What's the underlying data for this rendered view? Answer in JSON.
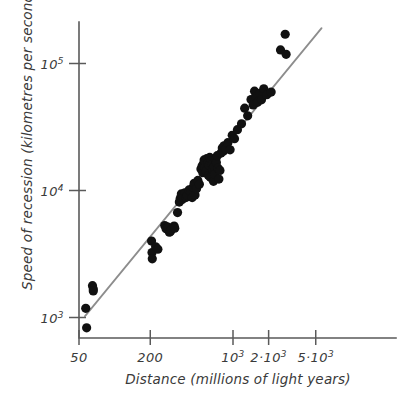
{
  "chart_data": {
    "type": "scatter",
    "title": "",
    "xlabel": "Distance (millions of light years)",
    "ylabel": "Speed of recession (kilometres per second)",
    "xscale": "log",
    "yscale": "log",
    "xlim": [
      50,
      6500
    ],
    "ylim": [
      800,
      220000
    ],
    "grid": false,
    "legend": null,
    "xticks": [
      {
        "value": 50,
        "label": "50",
        "mantissa": "50",
        "exponent": ""
      },
      {
        "value": 200,
        "label": "200",
        "mantissa": "200",
        "exponent": ""
      },
      {
        "value": 1000,
        "label": "10^3",
        "mantissa": "10",
        "exponent": "3"
      },
      {
        "value": 2000,
        "label": "2·10^3",
        "mantissa": "2·10",
        "exponent": "3"
      },
      {
        "value": 5000,
        "label": "5·10^3",
        "mantissa": "5·10",
        "exponent": "3"
      }
    ],
    "yticks": [
      {
        "value": 1000,
        "label": "10^3",
        "mantissa": "10",
        "exponent": "3"
      },
      {
        "value": 10000,
        "label": "10^4",
        "mantissa": "10",
        "exponent": "4"
      },
      {
        "value": 100000,
        "label": "10^5",
        "mantissa": "10",
        "exponent": "5"
      }
    ],
    "trendline": {
      "name": "Hubble law fit",
      "color": "#8d8d8d",
      "x": [
        56,
        5600
      ],
      "y": [
        1020,
        190000
      ]
    },
    "series": [
      {
        "name": "Galaxies",
        "color": "#111111",
        "marker": "circle",
        "marker_size": 4.6,
        "points": [
          [
            57,
            1180
          ],
          [
            58,
            830
          ],
          [
            65,
            1780
          ],
          [
            66,
            1680
          ],
          [
            66,
            1620
          ],
          [
            205,
            4000
          ],
          [
            207,
            3250
          ],
          [
            208,
            2900
          ],
          [
            222,
            3600
          ],
          [
            232,
            3450
          ],
          [
            265,
            5300
          ],
          [
            272,
            5000
          ],
          [
            282,
            5150
          ],
          [
            290,
            4700
          ],
          [
            296,
            4750
          ],
          [
            300,
            4900
          ],
          [
            318,
            5250
          ],
          [
            322,
            5050
          ],
          [
            340,
            6700
          ],
          [
            352,
            8100
          ],
          [
            358,
            8650
          ],
          [
            366,
            9400
          ],
          [
            372,
            8500
          ],
          [
            380,
            8900
          ],
          [
            392,
            9600
          ],
          [
            400,
            8800
          ],
          [
            410,
            9100
          ],
          [
            425,
            10100
          ],
          [
            438,
            9700
          ],
          [
            452,
            8800
          ],
          [
            460,
            10600
          ],
          [
            470,
            11400
          ],
          [
            478,
            9200
          ],
          [
            492,
            10300
          ],
          [
            505,
            12000
          ],
          [
            520,
            11200
          ],
          [
            536,
            14800
          ],
          [
            548,
            15600
          ],
          [
            556,
            13800
          ],
          [
            562,
            16200
          ],
          [
            570,
            17400
          ],
          [
            578,
            15200
          ],
          [
            584,
            16800
          ],
          [
            592,
            14200
          ],
          [
            600,
            17800
          ],
          [
            612,
            16400
          ],
          [
            620,
            13100
          ],
          [
            628,
            15800
          ],
          [
            636,
            18200
          ],
          [
            644,
            12700
          ],
          [
            652,
            17100
          ],
          [
            664,
            16000
          ],
          [
            672,
            14600
          ],
          [
            684,
            11800
          ],
          [
            692,
            15400
          ],
          [
            700,
            13400
          ],
          [
            712,
            17600
          ],
          [
            724,
            16600
          ],
          [
            736,
            18800
          ],
          [
            748,
            15000
          ],
          [
            760,
            12300
          ],
          [
            776,
            14400
          ],
          [
            792,
            19700
          ],
          [
            812,
            21600
          ],
          [
            828,
            20400
          ],
          [
            840,
            22500
          ],
          [
            868,
            21200
          ],
          [
            905,
            23800
          ],
          [
            945,
            20900
          ],
          [
            985,
            27200
          ],
          [
            1030,
            25600
          ],
          [
            1090,
            30100
          ],
          [
            1180,
            33500
          ],
          [
            1255,
            44500
          ],
          [
            1330,
            38700
          ],
          [
            1420,
            52000
          ],
          [
            1480,
            47200
          ],
          [
            1520,
            60500
          ],
          [
            1560,
            54800
          ],
          [
            1610,
            49500
          ],
          [
            1680,
            58200
          ],
          [
            1740,
            51800
          ],
          [
            1820,
            63200
          ],
          [
            1930,
            56800
          ],
          [
            2100,
            59600
          ],
          [
            2520,
            128000
          ],
          [
            2760,
            170000
          ],
          [
            2810,
            118000
          ]
        ]
      }
    ],
    "n_points": 88
  },
  "figure": {
    "background": "#ffffff",
    "axis_color": "#5a5a5a",
    "point_color": "#111111",
    "trend_color": "#8d8d8d"
  }
}
